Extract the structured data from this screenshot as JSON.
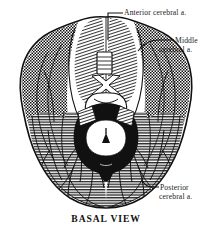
{
  "figure": {
    "caption": "BASAL  VIEW",
    "view_name": "BASAL VIEW",
    "background_color": "#ffffff",
    "ink_color": "#111111"
  },
  "labels": [
    {
      "id": "anterior",
      "line1": "Anterior cerebral a.",
      "line2": "",
      "territory": "anterior cerebral artery",
      "pattern": "diagonal-hatch",
      "leader": "elbow-down-to-midline"
    },
    {
      "id": "middle",
      "line1": "Middle",
      "line2": "cerebral a.",
      "territory": "middle cerebral artery",
      "pattern": "checkered",
      "leader": "curve-to-right-lateral-edge"
    },
    {
      "id": "posterior",
      "line1": "Posterior",
      "line2": "cerebral a.",
      "territory": "posterior cerebral artery",
      "pattern": "horizontal-lines",
      "leader": "short-hook-to-occipital-lobe"
    }
  ],
  "anatomy": {
    "regions": [
      {
        "name": "frontal-lobe-left",
        "fill": "diagonal-hatch"
      },
      {
        "name": "frontal-lobe-right",
        "fill": "diagonal-hatch"
      },
      {
        "name": "temporal-lobe-left",
        "fill": "checkered"
      },
      {
        "name": "temporal-lobe-right",
        "fill": "checkered"
      },
      {
        "name": "occipital-lobe-left",
        "fill": "horizontal-lines"
      },
      {
        "name": "occipital-lobe-right",
        "fill": "horizontal-lines"
      },
      {
        "name": "brainstem-midbrain",
        "fill": "solid-black"
      },
      {
        "name": "cerebral-peduncles",
        "fill": "white"
      },
      {
        "name": "optic-chiasm",
        "fill": "white"
      },
      {
        "name": "circle-of-willis",
        "fill": "outline"
      }
    ]
  }
}
